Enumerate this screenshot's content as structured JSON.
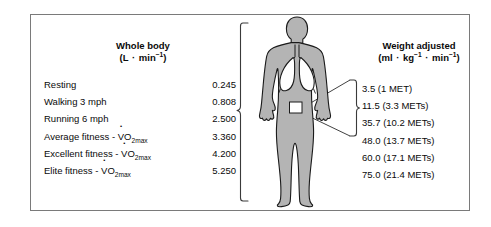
{
  "figure": {
    "body_fill_color": "#b4b4b4",
    "body_outline_color": "#1a1a1a",
    "organ_fill_color": "#ffffff",
    "border_color": "#7a7a7a",
    "text_color": "#0a0a0a"
  },
  "columns": {
    "whole_body": {
      "title": "Whole body",
      "units_prefix": "(L ",
      "units_dot": "·",
      "units_min": " min",
      "units_exp": "−1",
      "units_suffix": ")"
    },
    "weight_adjusted": {
      "title": "Weight adjusted",
      "units_open": "(ml ",
      "units_dot1": "·",
      "units_kg": " kg",
      "units_kg_exp": "−1",
      "units_dot2": " ·",
      "units_min": " min",
      "units_min_exp": "−1",
      "units_close": ")"
    }
  },
  "rows": [
    {
      "label": "Resting",
      "label_suffix": "",
      "has_vo2max": false,
      "whole_body": "0.245",
      "weight_adjusted": "3.5 (1 MET)"
    },
    {
      "label": "Walking 3 mph",
      "label_suffix": "",
      "has_vo2max": false,
      "whole_body": "0.808",
      "weight_adjusted": "11.5 (3.3 METs)"
    },
    {
      "label": "Running 6 mph",
      "label_suffix": "",
      "has_vo2max": false,
      "whole_body": "2.500",
      "weight_adjusted": "35.7 (10.2 METs)"
    },
    {
      "label": "Average fitness - ",
      "label_suffix": "",
      "has_vo2max": true,
      "whole_body": "3.360",
      "weight_adjusted": "48.0 (13.7 METs)"
    },
    {
      "label": "Excellent fitness - ",
      "label_suffix": "",
      "has_vo2max": true,
      "whole_body": "4.200",
      "weight_adjusted": "60.0 (17.1 METs)"
    },
    {
      "label": "Elite fitness - ",
      "label_suffix": "",
      "has_vo2max": true,
      "whole_body": "5.250",
      "weight_adjusted": "75.0 (21.4 METs)"
    }
  ],
  "vo2max": {
    "v": "V",
    "o": "O",
    "sub": "2max"
  }
}
